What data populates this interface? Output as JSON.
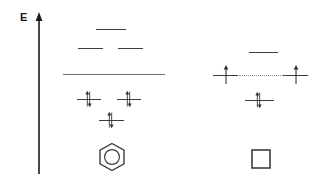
{
  "figure": {
    "type": "molecular-orbital-energy-diagram",
    "background_color": "#ffffff",
    "line_color": "#4a4a4a",
    "arrow_color": "#2b2b2b",
    "dotted_color": "#8d8d8d",
    "width": 320,
    "height": 183
  },
  "axis": {
    "label": "E",
    "name": "energy",
    "direction": "up",
    "color": "#1a1a1a",
    "x": 39,
    "y_top": 12,
    "y_bottom": 174
  },
  "diagrams": [
    {
      "id": "benzene",
      "molecule_label": "benzene-ring",
      "molecule_glyph": "hexagon-with-circle",
      "levels": [
        {
          "name": "antibonding-upper",
          "x1": 96,
          "x2": 126,
          "y": 29,
          "electrons": 0,
          "occupancy": "empty",
          "degeneracy": 1
        },
        {
          "name": "antibonding-degenerate-left",
          "x1": 78,
          "x2": 103,
          "y": 48,
          "electrons": 0,
          "occupancy": "empty",
          "degeneracy": 2
        },
        {
          "name": "antibonding-degenerate-right",
          "x1": 118,
          "x2": 143,
          "y": 48,
          "electrons": 0,
          "occupancy": "empty",
          "degeneracy": 2
        },
        {
          "name": "nonbonding-reference-line",
          "x1": 63,
          "x2": 165,
          "y": 74,
          "electrons": 0,
          "occupancy": "reference",
          "degeneracy": 0
        },
        {
          "name": "bonding-degenerate-left",
          "x1": 77,
          "x2": 101,
          "y": 99,
          "electrons": 2,
          "occupancy": "paired",
          "degeneracy": 2
        },
        {
          "name": "bonding-degenerate-right",
          "x1": 117,
          "x2": 141,
          "y": 99,
          "electrons": 2,
          "occupancy": "paired",
          "degeneracy": 2
        },
        {
          "name": "bonding-lowest",
          "x1": 99,
          "x2": 124,
          "y": 120,
          "electrons": 2,
          "occupancy": "paired",
          "degeneracy": 1
        }
      ],
      "total_pi_electrons": 6
    },
    {
      "id": "cyclobutadiene",
      "molecule_label": "square-ring",
      "molecule_glyph": "square",
      "levels": [
        {
          "name": "antibonding-upper",
          "x1": 249,
          "x2": 278,
          "y": 52,
          "electrons": 0,
          "occupancy": "empty",
          "degeneracy": 1
        },
        {
          "name": "nonbonding-somo-left",
          "x1": 213,
          "x2": 238,
          "y": 75,
          "electrons": 1,
          "occupancy": "single",
          "degeneracy": 2
        },
        {
          "name": "nonbonding-somo-right",
          "x1": 283,
          "x2": 308,
          "y": 75,
          "electrons": 1,
          "occupancy": "single",
          "degeneracy": 2
        },
        {
          "name": "bonding-lowest",
          "x1": 245,
          "x2": 274,
          "y": 100,
          "electrons": 2,
          "occupancy": "paired",
          "degeneracy": 1
        }
      ],
      "connector": {
        "name": "degenerate-somo-connector",
        "style": "dotted",
        "x1": 238,
        "x2": 283,
        "y": 75
      },
      "total_pi_electrons": 4
    }
  ],
  "electron_arrows": [
    {
      "parent": "benzene",
      "level": "bonding-degenerate-left",
      "x": 89,
      "y": 99,
      "spin": "up"
    },
    {
      "parent": "benzene",
      "level": "bonding-degenerate-left",
      "x": 89,
      "y": 99,
      "spin": "down"
    },
    {
      "parent": "benzene",
      "level": "bonding-degenerate-right",
      "x": 129,
      "y": 99,
      "spin": "up"
    },
    {
      "parent": "benzene",
      "level": "bonding-degenerate-right",
      "x": 129,
      "y": 99,
      "spin": "down"
    },
    {
      "parent": "benzene",
      "level": "bonding-lowest",
      "x": 111,
      "y": 120,
      "spin": "up"
    },
    {
      "parent": "benzene",
      "level": "bonding-lowest",
      "x": 111,
      "y": 120,
      "spin": "down"
    },
    {
      "parent": "cyclobutadiene",
      "level": "nonbonding-somo-left",
      "x": 225,
      "y": 75,
      "spin": "up"
    },
    {
      "parent": "cyclobutadiene",
      "level": "nonbonding-somo-right",
      "x": 295,
      "y": 75,
      "spin": "up"
    },
    {
      "parent": "cyclobutadiene",
      "level": "bonding-lowest",
      "x": 259,
      "y": 100,
      "spin": "up"
    },
    {
      "parent": "cyclobutadiene",
      "level": "bonding-lowest",
      "x": 259,
      "y": 100,
      "spin": "down"
    }
  ],
  "molecules": {
    "benzene": {
      "name": "hexagon-with-inner-circle",
      "cx": 112,
      "cy": 157,
      "radius": 14
    },
    "cyclobutadiene": {
      "name": "square-outline",
      "x": 251,
      "y": 149,
      "size": 19
    }
  }
}
